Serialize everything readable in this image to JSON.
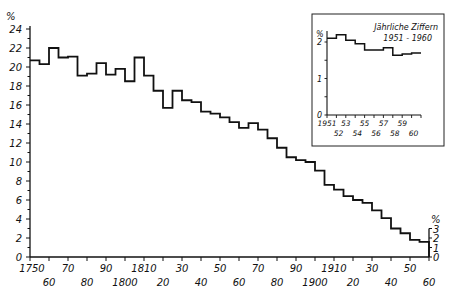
{
  "chart_data": [
    {
      "type": "line",
      "subtype": "step",
      "title": "",
      "xlabel": "",
      "ylabel": "%",
      "ylim": [
        0,
        24
      ],
      "xlim": [
        1750,
        1960
      ],
      "grid": false,
      "legend": null,
      "y_ticks": [
        "0",
        "2",
        "4",
        "6",
        "8",
        "10",
        "12",
        "14",
        "16",
        "18",
        "20",
        "22",
        "24"
      ],
      "x_ticks_upper": [
        "1750",
        "70",
        "90",
        "1810",
        "30",
        "50",
        "70",
        "90",
        "1910",
        "30",
        "50"
      ],
      "x_ticks_lower": [
        "60",
        "80",
        "1800",
        "20",
        "40",
        "60",
        "80",
        "1900",
        "20",
        "40",
        "60"
      ],
      "right_axis": {
        "label": "%",
        "ticks": [
          "0",
          "1",
          "2",
          "3"
        ]
      },
      "x": [
        1750,
        1755,
        1760,
        1765,
        1770,
        1775,
        1780,
        1785,
        1790,
        1795,
        1800,
        1805,
        1810,
        1815,
        1820,
        1825,
        1830,
        1835,
        1840,
        1845,
        1850,
        1855,
        1860,
        1865,
        1870,
        1875,
        1880,
        1885,
        1890,
        1895,
        1900,
        1905,
        1910,
        1915,
        1920,
        1925,
        1930,
        1935,
        1940,
        1945,
        1950,
        1955
      ],
      "series": [
        {
          "name": "Rate (5-year periods)",
          "values": [
            20.7,
            20.3,
            22.0,
            21.0,
            21.1,
            19.1,
            19.3,
            20.4,
            19.2,
            19.8,
            18.5,
            21.0,
            19.1,
            17.5,
            15.7,
            17.5,
            16.5,
            16.3,
            15.3,
            15.1,
            14.7,
            14.2,
            13.6,
            14.1,
            13.4,
            12.5,
            11.5,
            10.5,
            10.2,
            10.0,
            9.1,
            7.6,
            7.1,
            6.4,
            6.0,
            5.7,
            4.9,
            4.1,
            3.0,
            2.5,
            1.8,
            1.6
          ]
        }
      ]
    },
    {
      "type": "line",
      "subtype": "step",
      "title": "Jährliche Ziffern 1951–1960",
      "title_lines": [
        "Jährliche Ziffern",
        "1951 - 1960"
      ],
      "xlabel": "",
      "ylabel": "%",
      "ylim": [
        0,
        2.3
      ],
      "y_ticks": [
        "0",
        "1",
        "2"
      ],
      "x_ticks_upper": [
        "1951",
        "53",
        "55",
        "57",
        "59"
      ],
      "x_ticks_lower": [
        "52",
        "54",
        "56",
        "58",
        "60"
      ],
      "x": [
        1951,
        1952,
        1953,
        1954,
        1955,
        1956,
        1957,
        1958,
        1959,
        1960
      ],
      "series": [
        {
          "name": "Annual rate",
          "values": [
            2.1,
            2.2,
            2.05,
            1.95,
            1.78,
            1.78,
            1.84,
            1.64,
            1.67,
            1.7
          ]
        }
      ],
      "position": "inset top-right"
    }
  ]
}
